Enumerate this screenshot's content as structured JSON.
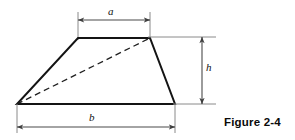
{
  "figure": {
    "caption": "Figure 2-4",
    "shape_name": "trapezoid",
    "labels": {
      "top_side": "a",
      "bottom_side": "b",
      "height": "h"
    },
    "colors": {
      "outline": "#141414",
      "dimension_line": "#5a5a5a",
      "extension_line": "#7a7a7a",
      "dashed_diagonal": "#222222",
      "background": "#ffffff",
      "caption_text": "#0a0a0a"
    },
    "geometry": {
      "top_left": [
        78,
        38
      ],
      "top_right": [
        150,
        38
      ],
      "bottom_right": [
        175,
        104
      ],
      "bottom_left": [
        17,
        104
      ],
      "diagonal_from": [
        17,
        104
      ],
      "diagonal_to": [
        150,
        38
      ],
      "dim_a_y": 20,
      "dim_a_x1": 78,
      "dim_a_x2": 150,
      "dim_b_y": 127,
      "dim_b_x1": 17,
      "dim_b_x2": 175,
      "dim_h_x": 202,
      "dim_h_y1": 38,
      "dim_h_y2": 104
    }
  }
}
